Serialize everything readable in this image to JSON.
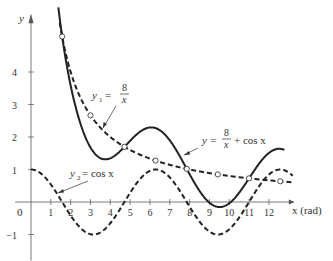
{
  "chart_data": {
    "type": "line",
    "title": "",
    "xlabel": "x (rad)",
    "ylabel": "y",
    "xlim": [
      0,
      13
    ],
    "ylim": [
      -1.5,
      5.5
    ],
    "x_ticks": [
      1,
      2,
      3,
      4,
      5,
      6,
      7,
      8,
      9,
      10,
      11,
      12
    ],
    "y_ticks": [
      -1,
      1,
      2,
      3,
      4
    ],
    "origin_label": "0",
    "grid": false,
    "series": [
      {
        "name": "y = 8/x + cos x",
        "style": "solid",
        "expr": "8/x + cos(x)",
        "x_range": [
          1.38,
          12.8
        ]
      },
      {
        "name": "y1 = 8/x",
        "style": "dashed",
        "expr": "8/x",
        "x_range": [
          1.45,
          13.2
        ]
      },
      {
        "name": "y2 = cos x",
        "style": "dashed",
        "expr": "cos(x)",
        "x_range": [
          0,
          13.2
        ]
      }
    ],
    "intersection_markers": [
      {
        "x": 1.571,
        "y": 5.093
      },
      {
        "x": 4.712,
        "y": 1.698
      },
      {
        "x": 7.854,
        "y": 1.019
      },
      {
        "x": 10.996,
        "y": 0.728
      },
      {
        "x": 3.0,
        "y": 2.667
      },
      {
        "x": 6.283,
        "y": 1.273
      },
      {
        "x": 9.42,
        "y": 0.849
      },
      {
        "x": 12.57,
        "y": 0.637
      }
    ],
    "annotations": [
      {
        "text": "y1 = 8/x",
        "anchor_x": 4.2,
        "anchor_y": 1.9
      },
      {
        "text": "y = 8/x + cos x",
        "anchor_x": 11.4,
        "anchor_y": 1.4
      },
      {
        "text": "y2 = cos x",
        "anchor_x": 1.3,
        "anchor_y": 0.3
      }
    ]
  },
  "labels": {
    "y_axis": "y",
    "x_axis": "x (rad)",
    "origin": "0",
    "y1_prefix": "y",
    "y1_sub": "1",
    "y1_eq": "=",
    "y1_num": "8",
    "y1_den": "x",
    "y_sum_prefix": "y =",
    "y_sum_num": "8",
    "y_sum_den": "x",
    "y_sum_suffix": "+ cos x",
    "y2_prefix": "y",
    "y2_sub": "2",
    "y2_eq": "= cos x"
  },
  "style": {
    "ink": "#222222",
    "axis": "#555555",
    "background": "#ffffff"
  }
}
